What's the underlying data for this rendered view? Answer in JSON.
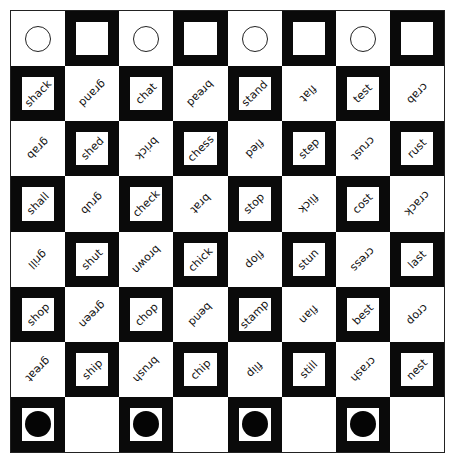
{
  "board": {
    "rows": 8,
    "cols": 8,
    "colors": {
      "dark": "#0a0a0a",
      "light": "#ffffff"
    },
    "cells": [
      [
        {
          "shade": "light",
          "piece": "ring"
        },
        {
          "shade": "dark",
          "piece": ""
        },
        {
          "shade": "light",
          "piece": "ring"
        },
        {
          "shade": "dark",
          "piece": ""
        },
        {
          "shade": "light",
          "piece": "ring"
        },
        {
          "shade": "dark",
          "piece": ""
        },
        {
          "shade": "light",
          "piece": "ring"
        },
        {
          "shade": "dark",
          "piece": ""
        }
      ],
      [
        {
          "shade": "dark",
          "word": "shack"
        },
        {
          "shade": "light",
          "word": "grand"
        },
        {
          "shade": "dark",
          "word": "chat"
        },
        {
          "shade": "light",
          "word": "bread"
        },
        {
          "shade": "dark",
          "word": "stand"
        },
        {
          "shade": "light",
          "word": "flat"
        },
        {
          "shade": "dark",
          "word": "test"
        },
        {
          "shade": "light",
          "word": "crab"
        }
      ],
      [
        {
          "shade": "light",
          "word": "grab"
        },
        {
          "shade": "dark",
          "word": "shed"
        },
        {
          "shade": "light",
          "word": "brick"
        },
        {
          "shade": "dark",
          "word": "chess"
        },
        {
          "shade": "light",
          "word": "fled"
        },
        {
          "shade": "dark",
          "word": "step"
        },
        {
          "shade": "light",
          "word": "crust"
        },
        {
          "shade": "dark",
          "word": "rust"
        }
      ],
      [
        {
          "shade": "dark",
          "word": "shall"
        },
        {
          "shade": "light",
          "word": "grub"
        },
        {
          "shade": "dark",
          "word": "check"
        },
        {
          "shade": "light",
          "word": "brat"
        },
        {
          "shade": "dark",
          "word": "stop"
        },
        {
          "shade": "light",
          "word": "flick"
        },
        {
          "shade": "dark",
          "word": "cost"
        },
        {
          "shade": "light",
          "word": "crack"
        }
      ],
      [
        {
          "shade": "light",
          "word": "grill"
        },
        {
          "shade": "dark",
          "word": "shut"
        },
        {
          "shade": "light",
          "word": "brown"
        },
        {
          "shade": "dark",
          "word": "chick"
        },
        {
          "shade": "light",
          "word": "flop"
        },
        {
          "shade": "dark",
          "word": "stun"
        },
        {
          "shade": "light",
          "word": "cress"
        },
        {
          "shade": "dark",
          "word": "last"
        }
      ],
      [
        {
          "shade": "dark",
          "word": "shop"
        },
        {
          "shade": "light",
          "word": "green"
        },
        {
          "shade": "dark",
          "word": "chop"
        },
        {
          "shade": "light",
          "word": "bend"
        },
        {
          "shade": "dark",
          "word": "stamp"
        },
        {
          "shade": "light",
          "word": "flan"
        },
        {
          "shade": "dark",
          "word": "best"
        },
        {
          "shade": "light",
          "word": "crop"
        }
      ],
      [
        {
          "shade": "light",
          "word": "great"
        },
        {
          "shade": "dark",
          "word": "ship"
        },
        {
          "shade": "light",
          "word": "brush"
        },
        {
          "shade": "dark",
          "word": "chip"
        },
        {
          "shade": "light",
          "word": "flip"
        },
        {
          "shade": "dark",
          "word": "still"
        },
        {
          "shade": "light",
          "word": "crash"
        },
        {
          "shade": "dark",
          "word": "nest"
        }
      ],
      [
        {
          "shade": "dark",
          "piece": "disc"
        },
        {
          "shade": "light",
          "piece": ""
        },
        {
          "shade": "dark",
          "piece": "disc"
        },
        {
          "shade": "light",
          "piece": ""
        },
        {
          "shade": "dark",
          "piece": "disc"
        },
        {
          "shade": "light",
          "piece": ""
        },
        {
          "shade": "dark",
          "piece": "disc"
        },
        {
          "shade": "light",
          "piece": ""
        }
      ]
    ]
  }
}
